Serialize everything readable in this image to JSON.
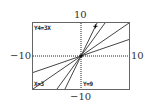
{
  "chart_data": {
    "type": "line",
    "title": "",
    "window": {
      "xmin": -10,
      "xmax": 10,
      "ymin": -10,
      "ymax": 10
    },
    "axis_labels": {
      "top": "10",
      "bottom": "−10",
      "left": "−10",
      "right": "10"
    },
    "series": [
      {
        "name": "Y1",
        "slope": 0.5
      },
      {
        "name": "Y2",
        "slope": 1
      },
      {
        "name": "Y3",
        "slope": 2
      },
      {
        "name": "Y4",
        "slope": 3
      }
    ],
    "trace": {
      "equation": "Y4=3X",
      "x_readout": "X=3",
      "y_readout": "Y=9",
      "x": 3,
      "y": 9
    }
  }
}
